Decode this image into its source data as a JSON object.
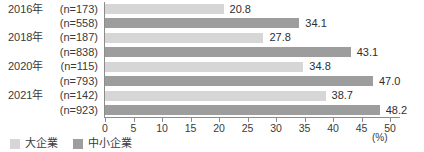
{
  "chart_data": {
    "type": "bar",
    "orientation": "horizontal",
    "unit_label": "(%)",
    "xlim": [
      0,
      50
    ],
    "xticks": [
      0,
      5,
      10,
      15,
      20,
      25,
      30,
      35,
      40,
      45,
      50
    ],
    "grid": false,
    "legend_position": "bottom-left",
    "series": [
      {
        "name": "大企業",
        "color": "#d6d6d6"
      },
      {
        "name": "中小企業",
        "color": "#9d9d9d"
      }
    ],
    "groups": [
      {
        "year": "2016年",
        "bars": [
          {
            "n_label": "(n=173)",
            "series": "大企業",
            "value": 20.8,
            "value_label": "20.8"
          },
          {
            "n_label": "(n=558)",
            "series": "中小企業",
            "value": 34.1,
            "value_label": "34.1"
          }
        ]
      },
      {
        "year": "2018年",
        "bars": [
          {
            "n_label": "(n=187)",
            "series": "大企業",
            "value": 27.8,
            "value_label": "27.8"
          },
          {
            "n_label": "(n=838)",
            "series": "中小企業",
            "value": 43.1,
            "value_label": "43.1"
          }
        ]
      },
      {
        "year": "2020年",
        "bars": [
          {
            "n_label": "(n=115)",
            "series": "大企業",
            "value": 34.8,
            "value_label": "34.8"
          },
          {
            "n_label": "(n=793)",
            "series": "中小企業",
            "value": 47.0,
            "value_label": "47.0"
          }
        ]
      },
      {
        "year": "2021年",
        "bars": [
          {
            "n_label": "(n=142)",
            "series": "大企業",
            "value": 38.7,
            "value_label": "38.7"
          },
          {
            "n_label": "(n=923)",
            "series": "中小企業",
            "value": 48.2,
            "value_label": "48.2"
          }
        ]
      }
    ],
    "legend": [
      {
        "label": "大企業",
        "color": "#d6d6d6"
      },
      {
        "label": "中小企業",
        "color": "#9d9d9d"
      }
    ]
  },
  "colors": {
    "axis": "#8c8c8c",
    "text": "#3a3a3a"
  }
}
